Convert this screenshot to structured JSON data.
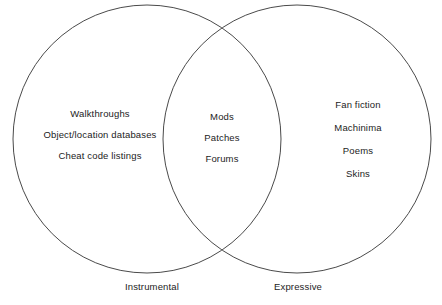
{
  "diagram": {
    "type": "venn",
    "title": "",
    "background_color": "#ffffff",
    "stroke_color": "#4a4a4a",
    "text_color": "#1c1c1c",
    "sets": [
      {
        "id": "instrumental",
        "label": "Instrumental",
        "items": [
          "Walkthroughs",
          "Object/location databases",
          "Cheat code listings"
        ]
      },
      {
        "id": "expressive",
        "label": "Expressive",
        "items": [
          "Fan fiction",
          "Machinima",
          "Poems",
          "Skins"
        ]
      }
    ],
    "intersection": {
      "id": "instrumental-expressive-overlap",
      "items": [
        "Mods",
        "Patches",
        "Forums"
      ]
    }
  }
}
